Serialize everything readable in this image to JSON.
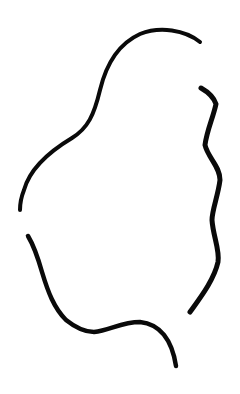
{
  "canvas": {
    "width": 240,
    "height": 394,
    "background": "#ffffff"
  },
  "drawing": {
    "description": "Hand-drawn ink outline of an abstract blob shape made of three strokes",
    "ink_color": "#0a0a0a",
    "strokes": [
      {
        "name": "stroke-left-top",
        "d": "M200,42 C185,30 160,26 140,34 C118,44 106,65 100,90 C94,115 88,128 72,138 C52,150 30,168 24,190 C20,200 20,208 20,210",
        "width": 4
      },
      {
        "name": "stroke-right",
        "d": "M201,88 C208,92 214,98 216,104 C213,118 207,130 205,145 C208,158 220,166 220,180 C218,196 212,210 212,220 C213,236 220,250 218,262 C214,280 200,298 190,312",
        "width": 5
      },
      {
        "name": "stroke-bottom",
        "d": "M28,236 C34,246 38,258 42,272 C48,292 54,308 66,320 C76,328 84,332 94,332 C110,330 122,322 140,322 C160,324 172,340 176,366",
        "width": 4.5
      }
    ]
  }
}
